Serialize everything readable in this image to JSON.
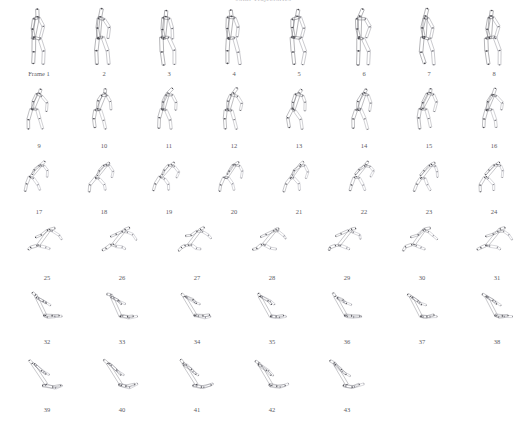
{
  "document": {
    "title_text": "Joint Trajectories",
    "title_visible": "clipped",
    "background_color": "#ffffff",
    "stroke_color": "#6e6e75",
    "joint_color": "#4a4a50",
    "label_color": "#5d5d63"
  },
  "sequence": {
    "first_frame_label": "Frame 1",
    "total_frames": 43,
    "rows": [
      {
        "index": 0,
        "top": 2,
        "height": 80,
        "label_y": 68,
        "frame_left": 6,
        "frame_step": 65,
        "pose": "standing",
        "frames": [
          {
            "n": 1,
            "label": "Frame 1"
          },
          {
            "n": 2,
            "label": "2"
          },
          {
            "n": 3,
            "label": "3"
          },
          {
            "n": 4,
            "label": "4"
          },
          {
            "n": 5,
            "label": "5"
          },
          {
            "n": 6,
            "label": "6"
          },
          {
            "n": 7,
            "label": "7"
          },
          {
            "n": 8,
            "label": "8"
          }
        ]
      },
      {
        "index": 1,
        "top": 84,
        "height": 66,
        "label_y": 58,
        "frame_left": 6,
        "frame_step": 65,
        "pose": "leaning",
        "frames": [
          {
            "n": 9,
            "label": "9"
          },
          {
            "n": 10,
            "label": "10"
          },
          {
            "n": 11,
            "label": "11"
          },
          {
            "n": 12,
            "label": "12"
          },
          {
            "n": 13,
            "label": "13"
          },
          {
            "n": 14,
            "label": "14"
          },
          {
            "n": 15,
            "label": "15"
          },
          {
            "n": 16,
            "label": "16"
          }
        ]
      },
      {
        "index": 2,
        "top": 158,
        "height": 58,
        "label_y": 50,
        "frame_left": 6,
        "frame_step": 65,
        "pose": "crouching",
        "frames": [
          {
            "n": 17,
            "label": "17"
          },
          {
            "n": 18,
            "label": "18"
          },
          {
            "n": 19,
            "label": "19"
          },
          {
            "n": 20,
            "label": "20"
          },
          {
            "n": 21,
            "label": "21"
          },
          {
            "n": 22,
            "label": "22"
          },
          {
            "n": 23,
            "label": "23"
          },
          {
            "n": 24,
            "label": "24"
          }
        ]
      },
      {
        "index": 3,
        "top": 224,
        "height": 56,
        "label_y": 50,
        "frame_left": 14,
        "frame_step": 75,
        "pose": "low-horizontal",
        "frames": [
          {
            "n": 25,
            "label": "25"
          },
          {
            "n": 26,
            "label": "26"
          },
          {
            "n": 27,
            "label": "27"
          },
          {
            "n": 28,
            "label": "28"
          },
          {
            "n": 29,
            "label": "29"
          },
          {
            "n": 30,
            "label": "30"
          },
          {
            "n": 31,
            "label": "31"
          }
        ]
      },
      {
        "index": 4,
        "top": 288,
        "height": 58,
        "label_y": 50,
        "frame_left": 14,
        "frame_step": 75,
        "pose": "rising-v",
        "frames": [
          {
            "n": 32,
            "label": "32"
          },
          {
            "n": 33,
            "label": "33"
          },
          {
            "n": 34,
            "label": "34"
          },
          {
            "n": 35,
            "label": "35"
          },
          {
            "n": 36,
            "label": "36"
          },
          {
            "n": 37,
            "label": "37"
          },
          {
            "n": 38,
            "label": "38"
          }
        ]
      },
      {
        "index": 5,
        "top": 356,
        "height": 60,
        "label_y": 50,
        "frame_left": 14,
        "frame_step": 75,
        "pose": "wide-v",
        "frames": [
          {
            "n": 39,
            "label": "39"
          },
          {
            "n": 40,
            "label": "40"
          },
          {
            "n": 41,
            "label": "41"
          },
          {
            "n": 42,
            "label": "42"
          },
          {
            "n": 43,
            "label": "43"
          }
        ]
      }
    ]
  },
  "skeleton": {
    "description": "stick figure built from elongated quadrilateral limb segments with joint markers",
    "segment_names": [
      "head",
      "neck",
      "torso",
      "upper-arm-near",
      "lower-arm-near",
      "upper-arm-far",
      "lower-arm-far",
      "thigh-near",
      "shin-near",
      "thigh-far",
      "shin-far"
    ],
    "joint_count": 11
  }
}
